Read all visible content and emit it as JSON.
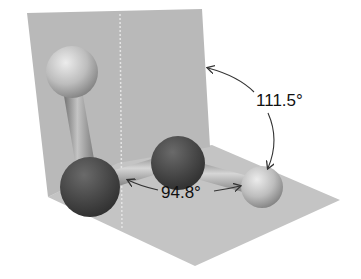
{
  "diagram": {
    "atoms": [
      {
        "id": "h1",
        "kind": "light"
      },
      {
        "id": "o1",
        "kind": "dark"
      },
      {
        "id": "o2",
        "kind": "dark"
      },
      {
        "id": "h2",
        "kind": "light"
      }
    ],
    "bonds": [
      {
        "from": "h1",
        "to": "o1"
      },
      {
        "from": "o1",
        "to": "o2"
      },
      {
        "from": "o2",
        "to": "h2"
      }
    ],
    "angles": {
      "dihedral": {
        "label": "111.5°",
        "value": 111.5
      },
      "bond": {
        "label": "94.8°",
        "value": 94.8
      }
    },
    "colors": {
      "plane": "#bdbdbd",
      "dark_atom": "#4a4a4a",
      "light_atom": "#c8c8c8",
      "arrow": "#333333",
      "text": "#111111"
    }
  }
}
